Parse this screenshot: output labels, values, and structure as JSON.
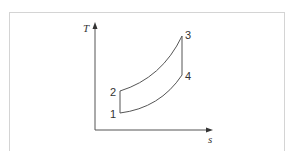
{
  "diagram": {
    "type": "T-s diagram",
    "axes": {
      "y_label": "T",
      "x_label": "s"
    },
    "points": [
      {
        "id": "1",
        "label": "1"
      },
      {
        "id": "2",
        "label": "2"
      },
      {
        "id": "3",
        "label": "3"
      },
      {
        "id": "4",
        "label": "4"
      }
    ],
    "processes": [
      {
        "from": "1",
        "to": "2",
        "shape": "vertical line"
      },
      {
        "from": "2",
        "to": "3",
        "shape": "curve"
      },
      {
        "from": "3",
        "to": "4",
        "shape": "vertical line"
      },
      {
        "from": "4",
        "to": "1",
        "shape": "curve"
      }
    ],
    "colors": {
      "line": "#555555",
      "frame": "#d4d4d4"
    }
  }
}
